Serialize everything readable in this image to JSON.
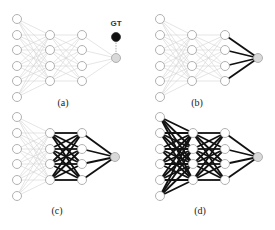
{
  "figure": {
    "width": 275,
    "height": 230,
    "colors": {
      "background": "#ffffff",
      "node_stroke": "#a8a8a8",
      "node_fill": "#ffffff",
      "output_fill": "#d9d9d9",
      "gt_fill": "#111111",
      "thin_edge": "#d4d4d4",
      "bold_edge": "#111111"
    },
    "node_radius": 4.5,
    "panels": [
      {
        "id": "a",
        "label": "(a)",
        "label_pos": [
          63,
          106
        ],
        "layers_x": [
          17,
          50,
          82,
          116
        ],
        "input_y": [
          19,
          35,
          50,
          66,
          81,
          97
        ],
        "hidden_y": [
          35,
          50,
          66,
          81
        ],
        "output_y": 58,
        "bold_layers": [],
        "gt": {
          "text": "GT",
          "text_pos": [
            116,
            26
          ],
          "node_y": 37
        }
      },
      {
        "id": "b",
        "label": "(b)",
        "label_pos": [
          197,
          106
        ],
        "layers_x": [
          160,
          192,
          225,
          258
        ],
        "input_y": [
          19,
          35,
          50,
          66,
          81,
          97
        ],
        "hidden_y": [
          35,
          50,
          66,
          81
        ],
        "output_y": 58,
        "bold_layers": [
          3
        ]
      },
      {
        "id": "c",
        "label": "(c)",
        "label_pos": [
          57,
          214
        ],
        "layers_x": [
          17,
          50,
          82,
          115
        ],
        "input_y": [
          117,
          133,
          149,
          164,
          180,
          196
        ],
        "hidden_y": [
          133,
          149,
          164,
          180
        ],
        "output_y": 157,
        "bold_layers": [
          2,
          3
        ]
      },
      {
        "id": "d",
        "label": "(d)",
        "label_pos": [
          200,
          214
        ],
        "layers_x": [
          160,
          193,
          225,
          258
        ],
        "input_y": [
          117,
          133,
          149,
          164,
          180,
          196
        ],
        "hidden_y": [
          133,
          149,
          164,
          180
        ],
        "output_y": 157,
        "bold_layers": [
          1,
          2,
          3
        ]
      }
    ]
  }
}
